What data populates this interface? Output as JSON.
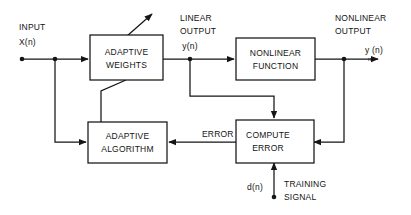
{
  "diagram": {
    "colors": {
      "line": "#151515",
      "text": "#141414",
      "background": "#ffffff"
    },
    "blocks": [
      {
        "id": "adaptive_weights",
        "line1": "ADAPTIVE",
        "line2": "WEIGHTS"
      },
      {
        "id": "nonlinear_function",
        "line1": "NONLINEAR",
        "line2": "FUNCTION"
      },
      {
        "id": "adaptive_algorithm",
        "line1": "ADAPTIVE",
        "line2": "ALGORITHM"
      },
      {
        "id": "compute_error",
        "line1": "COMPUTE",
        "line2": "ERROR"
      }
    ],
    "labels": {
      "input_line1": "INPUT",
      "input_line2": "X(n)",
      "linear_output_line1": "LINEAR",
      "linear_output_line2": "OUTPUT",
      "linear_output_signal": "y(n)",
      "nonlinear_output_line1": "NONLINEAR",
      "nonlinear_output_line2": "OUTPUT",
      "nonlinear_output_signal_main": "y (n)",
      "nonlinear_output_signal_sub": "nl",
      "error": "ERROR",
      "training_signal_symbol": "d(n)",
      "training_signal_line1": "TRAINING",
      "training_signal_line2": "SIGNAL"
    }
  }
}
